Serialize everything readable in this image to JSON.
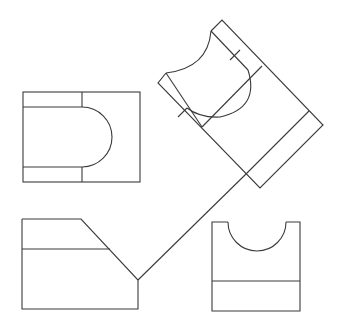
{
  "diagram": {
    "stroke_color": "#3a3a3a",
    "background": "#ffffff",
    "views": [
      {
        "name": "top-view",
        "description": "Rectangle with U-shaped slot opening left"
      },
      {
        "name": "auxiliary-view",
        "description": "Rotated 45 degree view with semicircular notch"
      },
      {
        "name": "front-view",
        "description": "Profile with chamfered corner"
      },
      {
        "name": "side-view",
        "description": "Rectangle with semicircular notch at top"
      }
    ],
    "projection_line": "miter line connecting front view to auxiliary view"
  }
}
